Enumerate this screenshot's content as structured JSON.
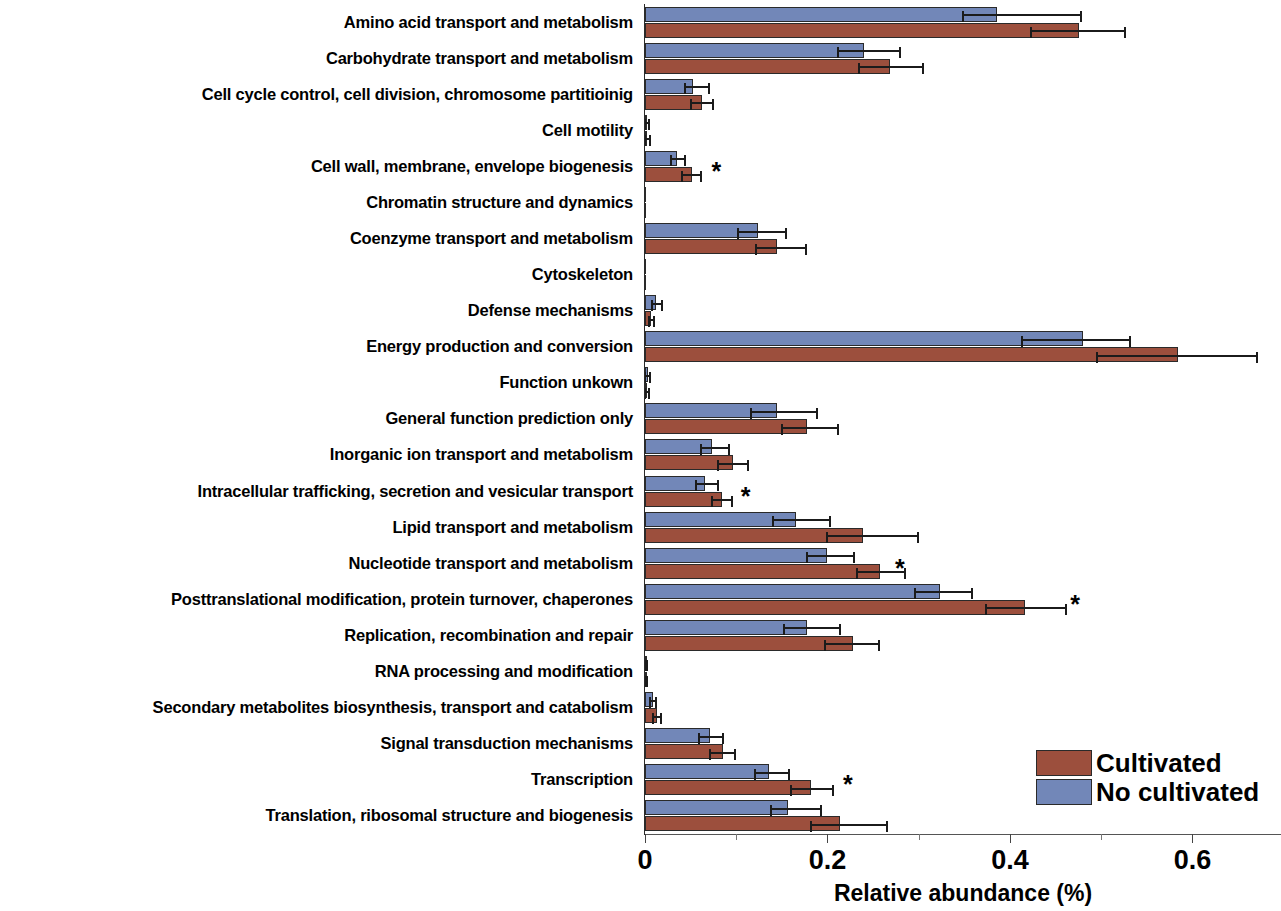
{
  "chart_data": {
    "type": "bar",
    "orientation": "horizontal",
    "title": "",
    "xlabel": "Relative abundance (%)",
    "ylabel": "",
    "xlim": [
      0,
      0.697
    ],
    "xticks": [
      0,
      0.1,
      0.2,
      0.3,
      0.4,
      0.5,
      0.6
    ],
    "xtick_labels": [
      "0",
      "",
      "0.2",
      "",
      "0.4",
      "",
      "0.6"
    ],
    "grid": false,
    "legend_position": "bottom-right",
    "colors": {
      "cultivated": "#9c4f3d",
      "no_cultivated": "#7287b8",
      "error_bar": "#1b1b1b"
    },
    "significance_marker": "*",
    "categories": [
      "Amino acid transport and metabolism",
      "Carbohydrate transport and metabolism",
      "Cell cycle control, cell division, chromosome partitioinig",
      "Cell motility",
      "Cell wall, membrane, envelope biogenesis",
      "Chromatin structure and dynamics",
      "Coenzyme transport and metabolism",
      "Cytoskeleton",
      "Defense mechanisms",
      "Energy production and conversion",
      "Function unkown",
      "General function prediction only",
      "Inorganic ion transport and metabolism",
      "Intracellular trafficking, secretion and vesicular transport",
      "Lipid transport and metabolism",
      "Nucleotide transport and metabolism",
      "Posttranslational modification, protein turnover, chaperones",
      "Replication, recombination and repair",
      "RNA processing and modification",
      "Secondary metabolites biosynthesis, transport and catabolism",
      "Signal transduction mechanisms",
      "Transcription",
      "Translation, ribosomal structure and biogenesis"
    ],
    "series": [
      {
        "name": "No cultivated",
        "color": "#7287b8",
        "values": [
          0.386,
          0.24,
          0.053,
          0.002,
          0.035,
          0.0,
          0.124,
          0.0,
          0.012,
          0.48,
          0.003,
          0.145,
          0.073,
          0.066,
          0.165,
          0.199,
          0.323,
          0.177,
          0.001,
          0.009,
          0.071,
          0.136,
          0.157
        ],
        "err_low": [
          0.348,
          0.212,
          0.044,
          0.0,
          0.029,
          0.0,
          0.102,
          0.0,
          0.008,
          0.413,
          0.0,
          0.116,
          0.061,
          0.056,
          0.14,
          0.177,
          0.296,
          0.152,
          0.0,
          0.006,
          0.059,
          0.121,
          0.138
        ],
        "err_high": [
          0.478,
          0.279,
          0.07,
          0.004,
          0.044,
          0.0,
          0.155,
          0.0,
          0.019,
          0.532,
          0.005,
          0.189,
          0.092,
          0.08,
          0.203,
          0.229,
          0.358,
          0.214,
          0.002,
          0.012,
          0.085,
          0.158,
          0.193
        ]
      },
      {
        "name": "Cultivated",
        "color": "#9c4f3d",
        "values": [
          0.476,
          0.268,
          0.062,
          0.002,
          0.052,
          0.0,
          0.145,
          0.0,
          0.007,
          0.584,
          0.002,
          0.178,
          0.096,
          0.084,
          0.239,
          0.257,
          0.416,
          0.228,
          0.001,
          0.013,
          0.085,
          0.182,
          0.214
        ],
        "err_low": [
          0.423,
          0.234,
          0.05,
          0.0,
          0.041,
          0.0,
          0.122,
          0.0,
          0.004,
          0.495,
          0.0,
          0.15,
          0.08,
          0.073,
          0.2,
          0.232,
          0.374,
          0.197,
          0.0,
          0.009,
          0.071,
          0.16,
          0.182
        ],
        "err_high": [
          0.526,
          0.305,
          0.075,
          0.005,
          0.061,
          0.0,
          0.176,
          0.0,
          0.01,
          0.671,
          0.004,
          0.212,
          0.113,
          0.095,
          0.299,
          0.285,
          0.461,
          0.257,
          0.002,
          0.017,
          0.099,
          0.206,
          0.265
        ]
      }
    ],
    "significant_categories": [
      "Cell wall, membrane, envelope biogenesis",
      "Intracellular trafficking, secretion and vesicular transport",
      "Nucleotide transport and metabolism",
      "Posttranslational modification, protein turnover, chaperones",
      "Transcription"
    ],
    "star_positions": {
      "Cell wall, membrane, envelope biogenesis": 0.073,
      "Intracellular trafficking, secretion and vesicular transport": 0.105,
      "Nucleotide transport and metabolism": 0.274,
      "Posttranslational modification, protein turnover, chaperones": 0.466,
      "Transcription": 0.217
    }
  },
  "legend": {
    "items": [
      {
        "label": "Cultivated",
        "color": "#9c4f3d"
      },
      {
        "label": "No cultivated",
        "color": "#7287b8"
      }
    ]
  },
  "axis": {
    "x_title": "Relative abundance (%)"
  }
}
